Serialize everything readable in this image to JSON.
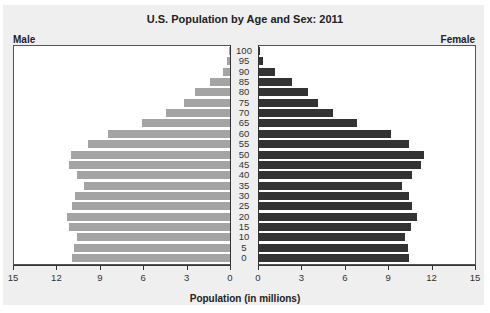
{
  "chart_data": {
    "type": "bar",
    "subtype": "population-pyramid",
    "title": "U.S. Population by Age and Sex: 2011",
    "xlabel": "Population (in millions)",
    "ylabel": "",
    "left_label": "Male",
    "right_label": "Female",
    "categories": [
      "100",
      "95",
      "90",
      "85",
      "80",
      "75",
      "70",
      "65",
      "60",
      "55",
      "50",
      "45",
      "40",
      "35",
      "30",
      "25",
      "20",
      "15",
      "10",
      "5",
      "0"
    ],
    "series": [
      {
        "name": "Male",
        "color": "#a4a4a4",
        "values": [
          0.05,
          0.2,
          0.5,
          1.4,
          2.4,
          3.2,
          4.4,
          6.1,
          8.4,
          9.8,
          11.0,
          11.1,
          10.6,
          10.1,
          10.7,
          10.9,
          11.3,
          11.1,
          10.6,
          10.8,
          10.9
        ]
      },
      {
        "name": "Female",
        "color": "#333333",
        "values": [
          0.05,
          0.3,
          1.1,
          2.3,
          3.4,
          4.1,
          5.1,
          6.8,
          9.1,
          10.4,
          11.4,
          11.2,
          10.6,
          9.9,
          10.4,
          10.6,
          10.9,
          10.5,
          10.1,
          10.3,
          10.4
        ]
      }
    ],
    "male_ticks": [
      "15",
      "12",
      "9",
      "6",
      "3",
      "0"
    ],
    "female_ticks": [
      "0",
      "3",
      "6",
      "9",
      "12",
      "15"
    ],
    "xlim": [
      0,
      15
    ],
    "grid": false,
    "legend": "side labels (Male left, Female right)"
  }
}
